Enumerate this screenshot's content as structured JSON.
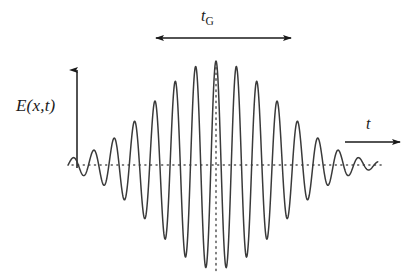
{
  "figure": {
    "title": "",
    "background_color": "#ffffff",
    "curve_color": "#3a3a3a",
    "axis_color": "#1a1a1a",
    "dotted_color": "#555555"
  },
  "labels": {
    "y_axis": "E(x,t)",
    "y_axis_parts": {
      "symbol": "E",
      "open": "(",
      "var1": "x",
      "comma": ",",
      "var2": "t",
      "close": ")"
    },
    "x_axis": "t",
    "duration": "tG",
    "duration_parts": {
      "base": "t",
      "subscript": "G"
    }
  },
  "axes": {
    "y_arrow": {
      "x": 77,
      "y_bottom": 168,
      "y_top": 68,
      "label": "E(x,t)"
    },
    "x_arrow": {
      "x_start": 345,
      "x_end": 402,
      "y": 142,
      "label": "t"
    },
    "baseline": {
      "y": 165,
      "x_start": 72,
      "x_end": 382,
      "style": "dotted"
    },
    "center_line": {
      "x": 216,
      "y_top": 62,
      "y_bottom": 272,
      "style": "dotted"
    }
  },
  "duration_marker": {
    "y": 38,
    "x_start": 154,
    "x_end": 293,
    "arrowheads": "both",
    "label": "tG"
  },
  "chart_data": {
    "type": "line",
    "title": "",
    "xlabel": "t",
    "ylabel": "E(x,t)",
    "envelope": "gaussian",
    "center_x": 216,
    "sigma_px": 62,
    "period_px": 20.4,
    "amplitude_px": 104,
    "x_range": [
      68,
      378
    ],
    "baseline_y": 165,
    "grid": false,
    "legend": false,
    "annotations": [
      {
        "text": "tG",
        "type": "duration-span",
        "x_start": 154,
        "x_end": 293,
        "y": 38
      },
      {
        "text": "E(x,t)",
        "type": "axis-label",
        "x": 16,
        "y": 97
      },
      {
        "text": "t",
        "type": "axis-label",
        "x": 366,
        "y": 116
      }
    ]
  }
}
